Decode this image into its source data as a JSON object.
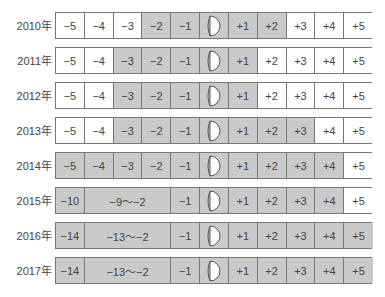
{
  "diagram": {
    "type": "table-timeline",
    "year_suffix": "年",
    "colors": {
      "shaded": "#cacaca",
      "unshaded": "#ffffff",
      "border": "#777777"
    },
    "center_icon": "moon-half-icon",
    "rows": [
      {
        "year": "2010年",
        "cells": [
          {
            "label": "−5",
            "shaded": false,
            "span": 1
          },
          {
            "label": "−4",
            "shaded": false,
            "span": 1
          },
          {
            "label": "−3",
            "shaded": false,
            "span": 1
          },
          {
            "label": "−2",
            "shaded": true,
            "span": 1
          },
          {
            "label": "−1",
            "shaded": true,
            "span": 1
          },
          {
            "label": "",
            "icon": true,
            "shaded": true,
            "span": 1
          },
          {
            "label": "+1",
            "shaded": true,
            "span": 1
          },
          {
            "label": "+2",
            "shaded": true,
            "span": 1
          },
          {
            "label": "+3",
            "shaded": false,
            "span": 1
          },
          {
            "label": "+4",
            "shaded": false,
            "span": 1
          },
          {
            "label": "+5",
            "shaded": false,
            "span": 1
          }
        ]
      },
      {
        "year": "2011年",
        "cells": [
          {
            "label": "−5",
            "shaded": false,
            "span": 1
          },
          {
            "label": "−4",
            "shaded": false,
            "span": 1
          },
          {
            "label": "−3",
            "shaded": true,
            "span": 1
          },
          {
            "label": "−2",
            "shaded": true,
            "span": 1
          },
          {
            "label": "−1",
            "shaded": true,
            "span": 1
          },
          {
            "label": "",
            "icon": true,
            "shaded": true,
            "span": 1
          },
          {
            "label": "+1",
            "shaded": true,
            "span": 1
          },
          {
            "label": "+2",
            "shaded": false,
            "span": 1
          },
          {
            "label": "+3",
            "shaded": false,
            "span": 1
          },
          {
            "label": "+4",
            "shaded": false,
            "span": 1
          },
          {
            "label": "+5",
            "shaded": false,
            "span": 1
          }
        ]
      },
      {
        "year": "2012年",
        "cells": [
          {
            "label": "−5",
            "shaded": false,
            "span": 1
          },
          {
            "label": "−4",
            "shaded": false,
            "span": 1
          },
          {
            "label": "−3",
            "shaded": true,
            "span": 1
          },
          {
            "label": "−2",
            "shaded": true,
            "span": 1
          },
          {
            "label": "−1",
            "shaded": true,
            "span": 1
          },
          {
            "label": "",
            "icon": true,
            "shaded": true,
            "span": 1
          },
          {
            "label": "+1",
            "shaded": true,
            "span": 1
          },
          {
            "label": "+2",
            "shaded": false,
            "span": 1
          },
          {
            "label": "+3",
            "shaded": false,
            "span": 1
          },
          {
            "label": "+4",
            "shaded": false,
            "span": 1
          },
          {
            "label": "+5",
            "shaded": false,
            "span": 1
          }
        ]
      },
      {
        "year": "2013年",
        "cells": [
          {
            "label": "−5",
            "shaded": false,
            "span": 1
          },
          {
            "label": "−4",
            "shaded": false,
            "span": 1
          },
          {
            "label": "−3",
            "shaded": true,
            "span": 1
          },
          {
            "label": "−2",
            "shaded": true,
            "span": 1
          },
          {
            "label": "−1",
            "shaded": true,
            "span": 1
          },
          {
            "label": "",
            "icon": true,
            "shaded": true,
            "span": 1
          },
          {
            "label": "+1",
            "shaded": true,
            "span": 1
          },
          {
            "label": "+2",
            "shaded": true,
            "span": 1
          },
          {
            "label": "+3",
            "shaded": true,
            "span": 1
          },
          {
            "label": "+4",
            "shaded": false,
            "span": 1
          },
          {
            "label": "+5",
            "shaded": false,
            "span": 1
          }
        ]
      },
      {
        "year": "2014年",
        "cells": [
          {
            "label": "−5",
            "shaded": true,
            "span": 1
          },
          {
            "label": "−4",
            "shaded": true,
            "span": 1
          },
          {
            "label": "−3",
            "shaded": true,
            "span": 1
          },
          {
            "label": "−2",
            "shaded": true,
            "span": 1
          },
          {
            "label": "−1",
            "shaded": true,
            "span": 1
          },
          {
            "label": "",
            "icon": true,
            "shaded": true,
            "span": 1
          },
          {
            "label": "+1",
            "shaded": true,
            "span": 1
          },
          {
            "label": "+2",
            "shaded": true,
            "span": 1
          },
          {
            "label": "+3",
            "shaded": true,
            "span": 1
          },
          {
            "label": "+4",
            "shaded": true,
            "span": 1
          },
          {
            "label": "+5",
            "shaded": false,
            "span": 1
          }
        ]
      },
      {
        "year": "2015年",
        "cells": [
          {
            "label": "−10",
            "shaded": true,
            "span": 1
          },
          {
            "label": "−9〜−2",
            "shaded": true,
            "span": 3
          },
          {
            "label": "−1",
            "shaded": true,
            "span": 1
          },
          {
            "label": "",
            "icon": true,
            "shaded": true,
            "span": 1
          },
          {
            "label": "+1",
            "shaded": true,
            "span": 1
          },
          {
            "label": "+2",
            "shaded": true,
            "span": 1
          },
          {
            "label": "+3",
            "shaded": true,
            "span": 1
          },
          {
            "label": "+4",
            "shaded": true,
            "span": 1
          },
          {
            "label": "+5",
            "shaded": false,
            "span": 1
          }
        ]
      },
      {
        "year": "2016年",
        "cells": [
          {
            "label": "−14",
            "shaded": true,
            "span": 1
          },
          {
            "label": "−13〜−2",
            "shaded": true,
            "span": 3
          },
          {
            "label": "−1",
            "shaded": true,
            "span": 1
          },
          {
            "label": "",
            "icon": true,
            "shaded": true,
            "span": 1
          },
          {
            "label": "+1",
            "shaded": true,
            "span": 1
          },
          {
            "label": "+2",
            "shaded": true,
            "span": 1
          },
          {
            "label": "+3",
            "shaded": true,
            "span": 1
          },
          {
            "label": "+4",
            "shaded": true,
            "span": 1
          },
          {
            "label": "+5",
            "shaded": true,
            "span": 1
          }
        ]
      },
      {
        "year": "2017年",
        "cells": [
          {
            "label": "−14",
            "shaded": true,
            "span": 1
          },
          {
            "label": "−13〜−2",
            "shaded": true,
            "span": 3
          },
          {
            "label": "−1",
            "shaded": true,
            "span": 1
          },
          {
            "label": "",
            "icon": true,
            "shaded": true,
            "span": 1
          },
          {
            "label": "+1",
            "shaded": true,
            "span": 1
          },
          {
            "label": "+2",
            "shaded": true,
            "span": 1
          },
          {
            "label": "+3",
            "shaded": true,
            "span": 1
          },
          {
            "label": "+4",
            "shaded": true,
            "span": 1
          },
          {
            "label": "+5",
            "shaded": true,
            "span": 1
          }
        ]
      }
    ]
  }
}
